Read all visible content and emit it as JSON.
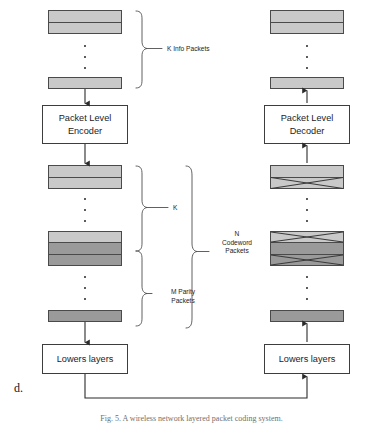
{
  "figure": {
    "panel_letter": "d.",
    "caption": "Fig. 5. A wireless network layered packet coding system."
  },
  "transmitter": {
    "encoder_box": {
      "line1": "Packet Level",
      "line2": "Encoder"
    },
    "lower_layers_box": {
      "line1": "Lowers layers"
    },
    "info_packets": [
      {
        "id": "tx-info-packet-top",
        "bands": [
          "light",
          "light"
        ]
      },
      {
        "id": "tx-info-packet-bottom",
        "bands": [
          "light"
        ]
      }
    ],
    "codeword_packets": [
      {
        "id": "tx-codeword-packet-1",
        "bands": [
          "light",
          "light"
        ]
      },
      {
        "id": "tx-codeword-packet-2",
        "bands": [
          "light",
          "dark",
          "dark"
        ]
      },
      {
        "id": "tx-codeword-packet-3",
        "bands": [
          "dark"
        ]
      }
    ],
    "brackets": {
      "info": "K Info Packets",
      "k": "K",
      "parity_line1": "M Parity",
      "parity_line2": "Packets",
      "codeword_line1": "N",
      "codeword_line2": "Codeword",
      "codeword_line3": "Packets"
    }
  },
  "receiver": {
    "decoder_box": {
      "line1": "Packet Level",
      "line2": "Decoder"
    },
    "lower_layers_box": {
      "line1": "Lowers layers"
    },
    "output_packets": [
      {
        "id": "rx-output-packet-top",
        "bands": [
          "light",
          "light"
        ]
      },
      {
        "id": "rx-output-packet-bottom",
        "bands": [
          "light"
        ]
      }
    ],
    "received_packets": [
      {
        "id": "rx-received-packet-1",
        "bands": [
          "light",
          "light"
        ],
        "erased": [
          1
        ]
      },
      {
        "id": "rx-received-packet-2",
        "bands": [
          "light",
          "dark",
          "dark"
        ],
        "erased": [
          0,
          2
        ]
      },
      {
        "id": "rx-received-packet-3",
        "bands": [
          "dark"
        ],
        "erased": []
      }
    ]
  }
}
